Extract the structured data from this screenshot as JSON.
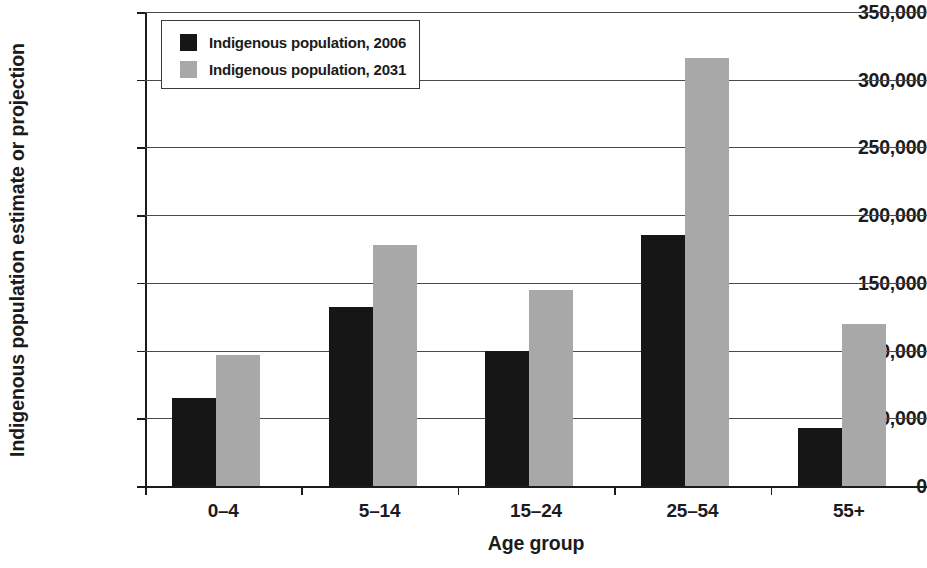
{
  "chart_data": {
    "type": "bar",
    "title": "",
    "xlabel": "Age group",
    "ylabel": "Indigenous population estimate or projection",
    "categories": [
      "0–4",
      "5–14",
      "15–24",
      "25–54",
      "55+"
    ],
    "series": [
      {
        "name": "Indigenous population, 2006",
        "color": "#161616",
        "values": [
          65000,
          132000,
          100000,
          185000,
          43000
        ]
      },
      {
        "name": "Indigenous population, 2031",
        "color": "#a8a8a8",
        "values": [
          97000,
          178000,
          145000,
          316000,
          120000
        ]
      }
    ],
    "ylim": [
      0,
      350000
    ],
    "ytick_values": [
      0,
      50000,
      100000,
      150000,
      200000,
      250000,
      300000,
      350000
    ],
    "ytick_labels": [
      "0",
      "50,000",
      "100,000",
      "150,000",
      "200,000",
      "250,000",
      "300,000",
      "350,000"
    ],
    "grid": true,
    "grid_axis": "y",
    "legend_position": "top-left"
  },
  "legend": {
    "entries": [
      {
        "label": "Indigenous population, 2006",
        "swatch_color": "#161616"
      },
      {
        "label": "Indigenous population, 2031",
        "swatch_color": "#a8a8a8"
      }
    ]
  },
  "axes": {
    "y_title": "Indigenous population estimate or projection",
    "x_title": "Age group"
  }
}
